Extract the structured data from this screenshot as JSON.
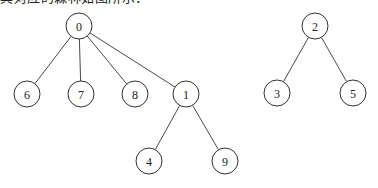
{
  "caption": "其对应的森林如图所示：",
  "forest": {
    "trees": [
      {
        "root": "0",
        "nodes": [
          {
            "id": "0",
            "label": "0",
            "x": 79,
            "y": 26
          },
          {
            "id": "6",
            "label": "6",
            "x": 27,
            "y": 94
          },
          {
            "id": "7",
            "label": "7",
            "x": 81,
            "y": 94
          },
          {
            "id": "8",
            "label": "8",
            "x": 135,
            "y": 94
          },
          {
            "id": "1",
            "label": "1",
            "x": 186,
            "y": 94
          },
          {
            "id": "4",
            "label": "4",
            "x": 149,
            "y": 161
          },
          {
            "id": "9",
            "label": "9",
            "x": 225,
            "y": 161
          }
        ],
        "edges": [
          [
            "0",
            "6"
          ],
          [
            "0",
            "7"
          ],
          [
            "0",
            "8"
          ],
          [
            "0",
            "1"
          ],
          [
            "1",
            "4"
          ],
          [
            "1",
            "9"
          ]
        ]
      },
      {
        "root": "2",
        "nodes": [
          {
            "id": "2",
            "label": "2",
            "x": 315,
            "y": 26
          },
          {
            "id": "3",
            "label": "3",
            "x": 277,
            "y": 93
          },
          {
            "id": "5",
            "label": "5",
            "x": 353,
            "y": 93
          }
        ],
        "edges": [
          [
            "2",
            "3"
          ],
          [
            "2",
            "5"
          ]
        ]
      }
    ],
    "node_radius": 13,
    "colors": {
      "stroke": "#333333",
      "fill": "#ffffff",
      "text": "#222222"
    }
  }
}
